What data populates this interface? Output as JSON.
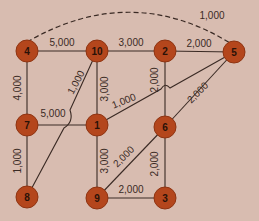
{
  "colors": {
    "background": "#d8bcb0",
    "node_fill": "#b4461c",
    "node_stroke": "#8e3412",
    "edge": "#3a2a24",
    "label": "#3a2a24"
  },
  "nodes": [
    {
      "id": "4",
      "label": "4",
      "x": 27,
      "y": 51
    },
    {
      "id": "10",
      "label": "10",
      "x": 97,
      "y": 51
    },
    {
      "id": "2",
      "label": "2",
      "x": 165,
      "y": 51
    },
    {
      "id": "5",
      "label": "5",
      "x": 234,
      "y": 52
    },
    {
      "id": "7",
      "label": "7",
      "x": 27,
      "y": 125
    },
    {
      "id": "1",
      "label": "1",
      "x": 97,
      "y": 125
    },
    {
      "id": "6",
      "label": "6",
      "x": 165,
      "y": 127
    },
    {
      "id": "8",
      "label": "8",
      "x": 27,
      "y": 197
    },
    {
      "id": "9",
      "label": "9",
      "x": 97,
      "y": 198
    },
    {
      "id": "3",
      "label": "3",
      "x": 165,
      "y": 198
    }
  ],
  "edges": [
    {
      "from": "4",
      "to": "10",
      "label": "5,000",
      "lx": 62,
      "ly": 46,
      "rot": 0
    },
    {
      "from": "10",
      "to": "2",
      "label": "3,000",
      "lx": 131,
      "ly": 46,
      "rot": 0
    },
    {
      "from": "2",
      "to": "5",
      "label": "2,000",
      "lx": 199,
      "ly": 47,
      "rot": 0
    },
    {
      "from": "4",
      "to": "7",
      "label": "4,000",
      "lx": 21,
      "ly": 88,
      "rot": -90
    },
    {
      "from": "7",
      "to": "8",
      "label": "1,000",
      "lx": 21,
      "ly": 161,
      "rot": -90
    },
    {
      "from": "10",
      "to": "1",
      "label": "3,000",
      "lx": 108,
      "ly": 89,
      "rot": -90
    },
    {
      "from": "1",
      "to": "9",
      "label": "3,000",
      "lx": 108,
      "ly": 161,
      "rot": -90
    },
    {
      "from": "2",
      "to": "6",
      "label": "2,000",
      "lx": 158,
      "ly": 80,
      "rot": -90
    },
    {
      "from": "6",
      "to": "3",
      "label": "2,000",
      "lx": 158,
      "ly": 164,
      "rot": -90
    },
    {
      "from": "7",
      "to": "1",
      "label": "5,000",
      "lx": 53,
      "ly": 117,
      "rot": 0
    },
    {
      "from": "10",
      "to": "8",
      "label": "1,000",
      "lx": 79,
      "ly": 84,
      "rot": -62
    },
    {
      "from": "1",
      "to": "5",
      "label": "1,000",
      "lx": 125,
      "ly": 104,
      "rot": -22
    },
    {
      "from": "6",
      "to": "5",
      "label": "2,000",
      "lx": 200,
      "ly": 95,
      "rot": -45
    },
    {
      "from": "9",
      "to": "6",
      "label": "2,000",
      "lx": 126,
      "ly": 159,
      "rot": -45
    },
    {
      "from": "9",
      "to": "3",
      "label": "2,000",
      "lx": 131,
      "ly": 193,
      "rot": 0
    },
    {
      "from": "4",
      "to": "5",
      "label": "1,000",
      "lx": 212,
      "ly": 19,
      "rot": 0,
      "style": "dashed"
    }
  ]
}
